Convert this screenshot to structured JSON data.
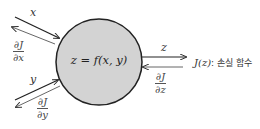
{
  "diagram": {
    "type": "computational-graph-node",
    "node": {
      "equation": "z = f(x, y)",
      "fill": "#d3d3d3",
      "stroke": "#222222"
    },
    "inputs": [
      {
        "forward_label": "x",
        "backward_label": {
          "numerator": "∂J",
          "denominator": "∂x"
        }
      },
      {
        "forward_label": "y",
        "backward_label": {
          "numerator": "∂J",
          "denominator": "∂y"
        }
      }
    ],
    "output": {
      "forward_label": "z",
      "backward_label": {
        "numerator": "∂J",
        "denominator": "∂z"
      },
      "target": {
        "function": "J(z)",
        "separator": ":",
        "description": "손실 함수"
      }
    }
  }
}
